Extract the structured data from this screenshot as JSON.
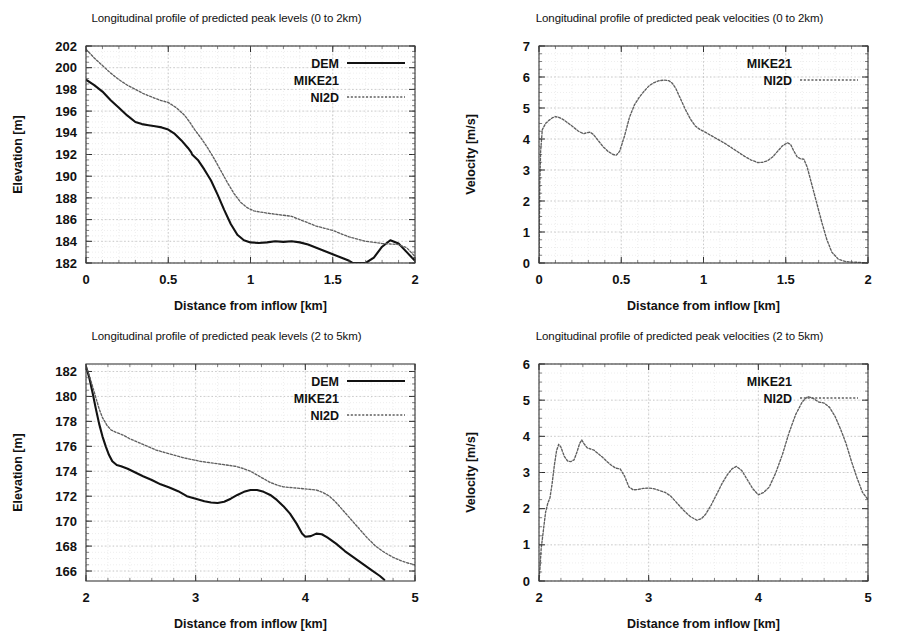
{
  "figure": {
    "name": "longitudinal-profiles-figure",
    "panel_count": 4
  },
  "common": {
    "xlabel": "Distance from inflow [km]",
    "ylabel_elevation": "Elevation [m]",
    "ylabel_velocity": "Velocity [m/s]",
    "series_names": [
      "DEM",
      "MIKE21",
      "NI2D"
    ],
    "colors": {
      "dem_line": "#121212",
      "ni2d_line": "#5f5f5f",
      "frame": "#3a3a3a",
      "grid_major": "#b9b9b9",
      "grid_minor": "#dcdcdc",
      "background": "#ffffff"
    }
  },
  "chart_data": [
    {
      "id": "peak-levels-0-2km",
      "type": "line",
      "title": "Longitudinal profile of predicted peak levels (0 to 2km)",
      "xlabel": "Distance from inflow [km]",
      "ylabel": "Elevation [m]",
      "xlim": [
        0,
        2
      ],
      "ylim": [
        182,
        202
      ],
      "xticks": [
        0,
        0.5,
        1,
        1.5,
        2
      ],
      "xtick_labels": [
        "0",
        "0.5",
        "1",
        "1.5",
        "2"
      ],
      "yticks": [
        182,
        184,
        186,
        188,
        190,
        192,
        194,
        196,
        198,
        200,
        202
      ],
      "ytick_labels": [
        "182",
        "184",
        "186",
        "188",
        "190",
        "192",
        "194",
        "196",
        "198",
        "200",
        "202"
      ],
      "grid": true,
      "legend_position": "top-right",
      "legend": [
        {
          "label": "DEM",
          "style": "solid"
        },
        {
          "label": "MIKE21",
          "style": "none"
        },
        {
          "label": "NI2D",
          "style": "dotted"
        }
      ],
      "series": [
        {
          "name": "DEM",
          "style": "solid",
          "x": [
            0,
            0.05,
            0.1,
            0.15,
            0.2,
            0.25,
            0.3,
            0.34,
            0.38,
            0.42,
            0.46,
            0.5,
            0.54,
            0.58,
            0.62,
            0.64,
            0.645,
            0.68,
            0.72,
            0.76,
            0.8,
            0.84,
            0.88,
            0.92,
            0.96,
            1.0,
            1.05,
            1.1,
            1.15,
            1.2,
            1.25,
            1.3,
            1.35,
            1.4,
            1.45,
            1.5,
            1.55,
            1.6,
            1.62,
            1.65,
            1.7,
            1.75,
            1.8,
            1.85,
            1.9,
            1.95,
            2.0
          ],
          "y": [
            198.9,
            198.4,
            197.8,
            197.0,
            196.3,
            195.6,
            195.0,
            194.8,
            194.7,
            194.6,
            194.5,
            194.3,
            193.9,
            193.3,
            192.6,
            192.2,
            192.0,
            191.5,
            190.6,
            189.6,
            188.3,
            186.9,
            185.6,
            184.6,
            184.1,
            183.9,
            183.85,
            183.9,
            184.0,
            183.95,
            184.0,
            183.9,
            183.7,
            183.4,
            183.1,
            182.8,
            182.5,
            182.2,
            182.0,
            182.0,
            182.0,
            182.5,
            183.5,
            184.1,
            183.8,
            183.0,
            182.2
          ]
        },
        {
          "name": "NI2D",
          "style": "dotted",
          "x": [
            0,
            0.05,
            0.1,
            0.15,
            0.2,
            0.25,
            0.3,
            0.35,
            0.4,
            0.45,
            0.5,
            0.55,
            0.6,
            0.63,
            0.66,
            0.7,
            0.74,
            0.78,
            0.82,
            0.86,
            0.9,
            0.94,
            0.98,
            1.02,
            1.06,
            1.1,
            1.15,
            1.2,
            1.25,
            1.3,
            1.35,
            1.4,
            1.45,
            1.5,
            1.55,
            1.6,
            1.65,
            1.7,
            1.75,
            1.8,
            1.85,
            1.9,
            1.95,
            2.0
          ],
          "y": [
            201.7,
            200.9,
            200.2,
            199.5,
            198.9,
            198.4,
            198.0,
            197.6,
            197.3,
            197.0,
            196.8,
            196.3,
            195.6,
            195.0,
            194.3,
            193.5,
            192.6,
            191.6,
            190.5,
            189.4,
            188.4,
            187.6,
            187.1,
            186.8,
            186.7,
            186.6,
            186.5,
            186.4,
            186.3,
            186.0,
            185.7,
            185.4,
            185.2,
            185.0,
            184.7,
            184.4,
            184.2,
            184.0,
            183.9,
            183.8,
            183.75,
            183.7,
            183.4,
            182.6
          ]
        }
      ]
    },
    {
      "id": "peak-velocities-0-2km",
      "type": "line",
      "title": "Longitudinal profile of predicted peak velocities (0 to 2km)",
      "xlabel": "Distance from inflow [km]",
      "ylabel": "Velocity [m/s]",
      "xlim": [
        0,
        2
      ],
      "ylim": [
        0,
        7
      ],
      "xticks": [
        0,
        0.5,
        1,
        1.5,
        2
      ],
      "xtick_labels": [
        "0",
        "0.5",
        "1",
        "1.5",
        "2"
      ],
      "yticks": [
        0,
        1,
        2,
        3,
        4,
        5,
        6,
        7
      ],
      "ytick_labels": [
        "0",
        "1",
        "2",
        "3",
        "4",
        "5",
        "6",
        "7"
      ],
      "grid": true,
      "legend_position": "top-right",
      "legend": [
        {
          "label": "MIKE21",
          "style": "none"
        },
        {
          "label": "NI2D",
          "style": "dotted"
        }
      ],
      "series": [
        {
          "name": "NI2D",
          "style": "dotted",
          "x": [
            0,
            0.005,
            0.01,
            0.02,
            0.04,
            0.06,
            0.08,
            0.1,
            0.12,
            0.15,
            0.18,
            0.21,
            0.24,
            0.27,
            0.29,
            0.31,
            0.33,
            0.36,
            0.39,
            0.42,
            0.45,
            0.47,
            0.49,
            0.52,
            0.55,
            0.58,
            0.61,
            0.64,
            0.67,
            0.7,
            0.73,
            0.76,
            0.79,
            0.81,
            0.83,
            0.86,
            0.89,
            0.92,
            0.95,
            0.98,
            1.01,
            1.05,
            1.09,
            1.13,
            1.17,
            1.21,
            1.25,
            1.29,
            1.33,
            1.36,
            1.39,
            1.42,
            1.45,
            1.48,
            1.51,
            1.53,
            1.55,
            1.57,
            1.59,
            1.61,
            1.63,
            1.66,
            1.69,
            1.72,
            1.75,
            1.78,
            1.82,
            1.86,
            1.9,
            1.95,
            2.0
          ],
          "y": [
            0.0,
            2.6,
            3.6,
            4.3,
            4.5,
            4.6,
            4.68,
            4.72,
            4.7,
            4.62,
            4.5,
            4.38,
            4.25,
            4.17,
            4.2,
            4.22,
            4.15,
            3.95,
            3.75,
            3.6,
            3.5,
            3.48,
            3.6,
            4.1,
            4.7,
            5.1,
            5.35,
            5.55,
            5.72,
            5.82,
            5.88,
            5.9,
            5.88,
            5.8,
            5.65,
            5.3,
            4.95,
            4.65,
            4.42,
            4.3,
            4.22,
            4.1,
            3.98,
            3.86,
            3.72,
            3.58,
            3.44,
            3.32,
            3.24,
            3.25,
            3.3,
            3.42,
            3.6,
            3.78,
            3.88,
            3.82,
            3.6,
            3.42,
            3.36,
            3.35,
            3.1,
            2.5,
            1.9,
            1.3,
            0.75,
            0.35,
            0.12,
            0.05,
            0.03,
            0.02,
            0.0
          ]
        }
      ]
    },
    {
      "id": "peak-levels-2-5km",
      "type": "line",
      "title": "Longitudinal profile of predicted peak levels (2 to 5km)",
      "xlabel": "Distance from inflow [km]",
      "ylabel": "Elevation [m]",
      "xlim": [
        2,
        5
      ],
      "ylim": [
        165.2,
        182.6
      ],
      "xticks": [
        2,
        3,
        4,
        5
      ],
      "xtick_labels": [
        "2",
        "3",
        "4",
        "5"
      ],
      "yticks": [
        166,
        168,
        170,
        172,
        174,
        176,
        178,
        180,
        182
      ],
      "ytick_labels": [
        "166",
        "168",
        "170",
        "172",
        "174",
        "176",
        "178",
        "180",
        "182"
      ],
      "grid": true,
      "legend_position": "top-right",
      "legend": [
        {
          "label": "DEM",
          "style": "solid"
        },
        {
          "label": "MIKE21",
          "style": "none"
        },
        {
          "label": "NI2D",
          "style": "dotted"
        }
      ],
      "series": [
        {
          "name": "DEM",
          "style": "solid",
          "x": [
            2.0,
            2.03,
            2.06,
            2.09,
            2.12,
            2.15,
            2.18,
            2.21,
            2.24,
            2.28,
            2.32,
            2.38,
            2.45,
            2.52,
            2.6,
            2.68,
            2.76,
            2.84,
            2.92,
            3.0,
            3.08,
            3.14,
            3.2,
            3.26,
            3.32,
            3.38,
            3.44,
            3.5,
            3.56,
            3.62,
            3.68,
            3.74,
            3.8,
            3.86,
            3.92,
            3.97,
            4.0,
            4.05,
            4.1,
            4.15,
            4.2,
            4.28,
            4.36,
            4.44,
            4.52,
            4.6,
            4.68,
            4.72
          ],
          "y": [
            182.4,
            181.5,
            180.3,
            179.0,
            177.8,
            176.8,
            176.0,
            175.3,
            174.8,
            174.5,
            174.4,
            174.2,
            173.9,
            173.6,
            173.3,
            172.95,
            172.7,
            172.4,
            172.0,
            171.8,
            171.6,
            171.5,
            171.45,
            171.55,
            171.8,
            172.1,
            172.35,
            172.5,
            172.5,
            172.35,
            172.1,
            171.7,
            171.2,
            170.6,
            169.8,
            169.0,
            168.75,
            168.8,
            169.0,
            168.95,
            168.7,
            168.2,
            167.6,
            167.1,
            166.6,
            166.1,
            165.6,
            165.3
          ]
        },
        {
          "name": "NI2D",
          "style": "dotted",
          "x": [
            2.0,
            2.03,
            2.06,
            2.09,
            2.12,
            2.15,
            2.19,
            2.23,
            2.28,
            2.34,
            2.4,
            2.48,
            2.56,
            2.64,
            2.72,
            2.8,
            2.88,
            2.96,
            3.04,
            3.12,
            3.2,
            3.28,
            3.36,
            3.44,
            3.5,
            3.56,
            3.62,
            3.68,
            3.74,
            3.8,
            3.86,
            3.92,
            3.98,
            4.04,
            4.1,
            4.16,
            4.22,
            4.28,
            4.34,
            4.4,
            4.48,
            4.56,
            4.64,
            4.72,
            4.8,
            4.88,
            4.95,
            5.0
          ],
          "y": [
            182.4,
            181.7,
            180.8,
            179.9,
            179.0,
            178.3,
            177.7,
            177.3,
            177.1,
            176.9,
            176.6,
            176.3,
            176.0,
            175.7,
            175.5,
            175.3,
            175.1,
            174.95,
            174.8,
            174.7,
            174.6,
            174.5,
            174.4,
            174.2,
            174.0,
            173.7,
            173.4,
            173.1,
            172.9,
            172.75,
            172.7,
            172.65,
            172.6,
            172.55,
            172.5,
            172.3,
            172.0,
            171.5,
            170.9,
            170.3,
            169.5,
            168.7,
            168.0,
            167.5,
            167.1,
            166.8,
            166.6,
            166.5
          ]
        }
      ]
    },
    {
      "id": "peak-velocities-2-5km",
      "type": "line",
      "title": "Longitudinal profile of predicted peak velocities (2 to 5km)",
      "xlabel": "Distance from inflow [km]",
      "ylabel": "Velocity [m/s]",
      "xlim": [
        2,
        5
      ],
      "ylim": [
        0,
        6
      ],
      "xticks": [
        2,
        3,
        4,
        5
      ],
      "xtick_labels": [
        "2",
        "3",
        "4",
        "5"
      ],
      "yticks": [
        0,
        1,
        2,
        3,
        4,
        5,
        6
      ],
      "ytick_labels": [
        "0",
        "1",
        "2",
        "3",
        "4",
        "5",
        "6"
      ],
      "grid": true,
      "legend_position": "top-right",
      "legend": [
        {
          "label": "MIKE21",
          "style": "none"
        },
        {
          "label": "NI2D",
          "style": "dotted"
        }
      ],
      "series": [
        {
          "name": "NI2D",
          "style": "dotted",
          "x": [
            2.0,
            2.01,
            2.02,
            2.04,
            2.06,
            2.08,
            2.1,
            2.12,
            2.14,
            2.16,
            2.18,
            2.2,
            2.23,
            2.26,
            2.29,
            2.32,
            2.35,
            2.37,
            2.39,
            2.41,
            2.44,
            2.47,
            2.5,
            2.54,
            2.58,
            2.62,
            2.66,
            2.7,
            2.74,
            2.78,
            2.82,
            2.86,
            2.9,
            2.95,
            3.0,
            3.05,
            3.1,
            3.15,
            3.2,
            3.26,
            3.32,
            3.38,
            3.44,
            3.48,
            3.52,
            3.57,
            3.62,
            3.67,
            3.72,
            3.76,
            3.8,
            3.85,
            3.9,
            3.95,
            4.0,
            4.05,
            4.1,
            4.16,
            4.22,
            4.28,
            4.34,
            4.4,
            4.45,
            4.5,
            4.55,
            4.6,
            4.65,
            4.7,
            4.75,
            4.8,
            4.85,
            4.9,
            4.95,
            5.0
          ],
          "y": [
            0.0,
            0.4,
            0.9,
            1.4,
            1.9,
            2.15,
            2.3,
            2.7,
            3.2,
            3.6,
            3.78,
            3.7,
            3.45,
            3.32,
            3.3,
            3.35,
            3.6,
            3.8,
            3.9,
            3.8,
            3.68,
            3.65,
            3.62,
            3.52,
            3.42,
            3.3,
            3.2,
            3.12,
            3.1,
            2.9,
            2.6,
            2.52,
            2.53,
            2.56,
            2.57,
            2.55,
            2.5,
            2.45,
            2.35,
            2.15,
            1.95,
            1.78,
            1.68,
            1.72,
            1.85,
            2.1,
            2.4,
            2.7,
            2.95,
            3.1,
            3.17,
            3.05,
            2.8,
            2.55,
            2.38,
            2.45,
            2.6,
            3.0,
            3.5,
            4.1,
            4.6,
            4.95,
            5.1,
            5.05,
            4.95,
            4.92,
            4.8,
            4.55,
            4.2,
            3.8,
            3.3,
            2.85,
            2.45,
            2.25
          ]
        }
      ]
    }
  ]
}
